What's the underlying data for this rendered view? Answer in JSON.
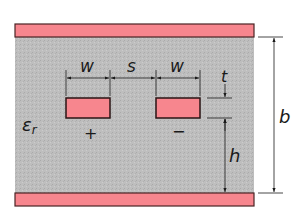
{
  "diagram": {
    "labels": {
      "width_left": "w",
      "spacing": "s",
      "width_right": "w",
      "thickness": "t",
      "height": "h",
      "total_height": "b",
      "permittivity_main": "ε",
      "permittivity_sub": "r",
      "positive": "+",
      "negative": "−"
    },
    "colors": {
      "plate_fill": "#f7868e",
      "plate_border": "#4a2324",
      "dielectric_fill": "#bdbdbd",
      "strip_fill": "#f7868e",
      "line": "#1a1a1a"
    },
    "caption_partial": ""
  }
}
